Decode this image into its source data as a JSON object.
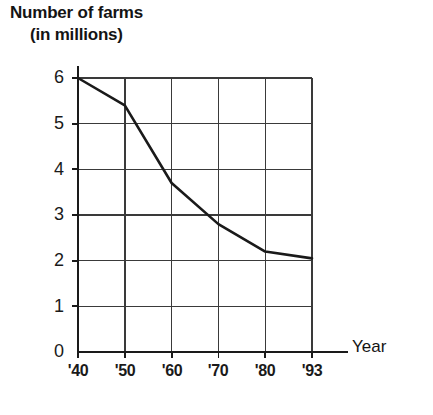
{
  "title": {
    "line1": "Number of farms",
    "line2": "(in millions)"
  },
  "axes": {
    "x_label": "Year",
    "y_label": "Number of farms (in millions)",
    "y_ticks": [
      "6",
      "5",
      "4",
      "3",
      "2",
      "1",
      "0"
    ],
    "x_ticks": [
      "'40",
      "'50",
      "'60",
      "'70",
      "'80",
      "'93"
    ]
  },
  "colors": {
    "line": "#1a1a1a",
    "grid": "#3a3a3a",
    "axis": "#1a1a1a",
    "background": "#ffffff"
  },
  "chart_data": {
    "type": "line",
    "title": "Number of farms (in millions)",
    "xlabel": "Year",
    "ylabel": "Number of farms (in millions)",
    "categories": [
      "'40",
      "'50",
      "'60",
      "'70",
      "'80",
      "'93"
    ],
    "x": [
      1940,
      1950,
      1960,
      1970,
      1980,
      1993
    ],
    "values": [
      6.0,
      5.4,
      3.7,
      2.8,
      2.2,
      2.05
    ],
    "series": [
      {
        "name": "Number of farms",
        "values": [
          6.0,
          5.4,
          3.7,
          2.8,
          2.2,
          2.05
        ]
      }
    ],
    "ylim": [
      0,
      6
    ],
    "xlim": [
      "'40",
      "'93"
    ],
    "y_ticks": [
      0,
      1,
      2,
      3,
      4,
      5,
      6
    ],
    "x_tick_labels": [
      "'40",
      "'50",
      "'60",
      "'70",
      "'80",
      "'93"
    ],
    "grid": true,
    "legend": false,
    "units": "millions"
  }
}
